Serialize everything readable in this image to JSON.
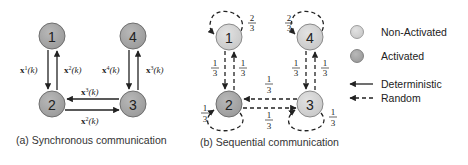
{
  "colors": {
    "non_activated": "#d4d4d4",
    "activated": "#a9a9a9",
    "stroke": "#707070",
    "edge": "#222222"
  },
  "panel_a": {
    "caption": "(a) Synchronous communication",
    "nodes": [
      {
        "id": "1",
        "label": "1",
        "state": "activated"
      },
      {
        "id": "2",
        "label": "2",
        "state": "activated"
      },
      {
        "id": "3",
        "label": "3",
        "state": "activated"
      },
      {
        "id": "4",
        "label": "4",
        "state": "activated"
      }
    ],
    "edges": [
      {
        "from": "1",
        "to": "2",
        "label_base": "x",
        "label_sup": "1",
        "label_arg": "(k)",
        "style": "deterministic"
      },
      {
        "from": "2",
        "to": "1",
        "label_base": "x",
        "label_sup": "2",
        "label_arg": "(k)",
        "style": "deterministic"
      },
      {
        "from": "4",
        "to": "3",
        "label_base": "x",
        "label_sup": "4",
        "label_arg": "(k)",
        "style": "deterministic"
      },
      {
        "from": "3",
        "to": "4",
        "label_base": "x",
        "label_sup": "3",
        "label_arg": "(k)",
        "style": "deterministic"
      },
      {
        "from": "3",
        "to": "2",
        "label_base": "x",
        "label_sup": "3",
        "label_arg": "(k)",
        "style": "deterministic"
      },
      {
        "from": "2",
        "to": "3",
        "label_base": "x",
        "label_sup": "2",
        "label_arg": "(k)",
        "style": "deterministic"
      }
    ]
  },
  "panel_b": {
    "caption": "(b) Sequential communication",
    "nodes": [
      {
        "id": "1",
        "label": "1",
        "state": "non-activated"
      },
      {
        "id": "2",
        "label": "2",
        "state": "activated"
      },
      {
        "id": "3",
        "label": "3",
        "state": "non-activated"
      },
      {
        "id": "4",
        "label": "4",
        "state": "non-activated"
      }
    ],
    "edges": [
      {
        "from": "1",
        "to": "1",
        "num": "2",
        "den": "3",
        "style": "random"
      },
      {
        "from": "4",
        "to": "4",
        "num": "2",
        "den": "3",
        "style": "random"
      },
      {
        "from": "1",
        "to": "2",
        "num": "1",
        "den": "3",
        "style": "random"
      },
      {
        "from": "2",
        "to": "1",
        "num": "1",
        "den": "3",
        "style": "random"
      },
      {
        "from": "4",
        "to": "3",
        "num": "1",
        "den": "3",
        "style": "random"
      },
      {
        "from": "3",
        "to": "4",
        "num": "1",
        "den": "3",
        "style": "random"
      },
      {
        "from": "3",
        "to": "2",
        "num": "1",
        "den": "3",
        "style": "random"
      },
      {
        "from": "2",
        "to": "3",
        "num": "1",
        "den": "3",
        "style": "random"
      },
      {
        "from": "2",
        "to": "2",
        "num": "1",
        "den": "3",
        "style": "random"
      },
      {
        "from": "3",
        "to": "3",
        "num": "1",
        "den": "3",
        "style": "random"
      }
    ]
  },
  "legend": {
    "non_activated": "Non-Activated",
    "activated": "Activated",
    "deterministic": "Deterministic",
    "random": "Random"
  }
}
